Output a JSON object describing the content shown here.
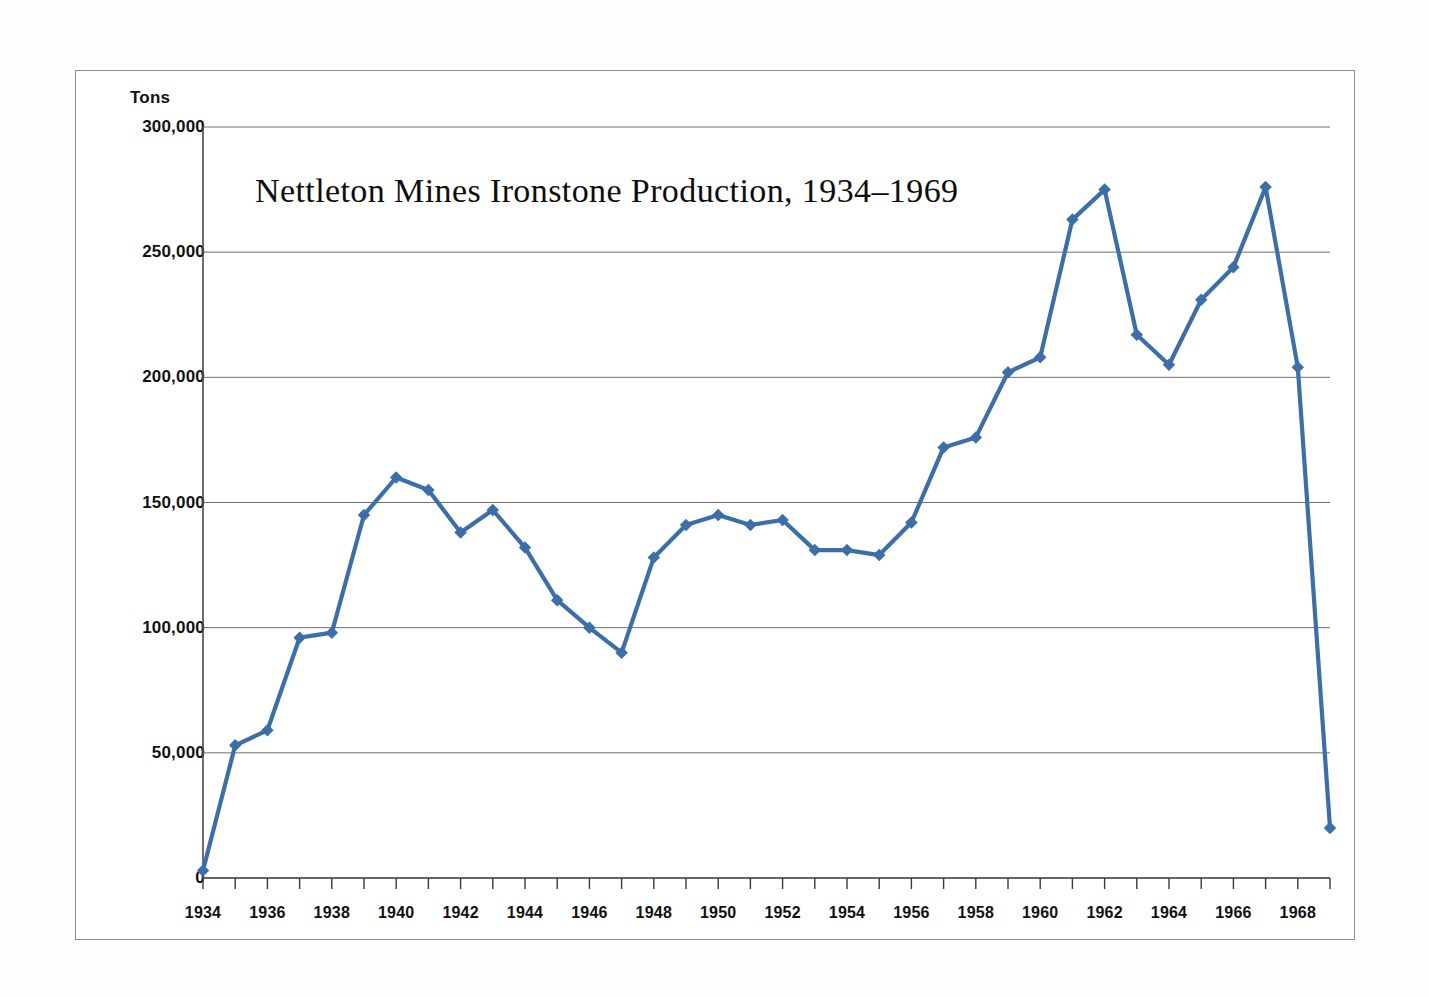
{
  "chart_data": {
    "type": "line",
    "title": "Nettleton Mines Ironstone Production, 1934–1969",
    "xlabel": "",
    "ylabel": "Tons",
    "ylim": [
      0,
      300000
    ],
    "xlim": [
      1934,
      1969
    ],
    "grid": true,
    "legend": "none",
    "y_ticks": [
      300000,
      250000,
      200000,
      150000,
      100000,
      50000,
      0
    ],
    "y_tick_labels": [
      "300,000",
      "250,000",
      "200,000",
      "150,000",
      "100,000",
      "50,000",
      "0"
    ],
    "x_ticks": [
      1934,
      1936,
      1938,
      1940,
      1942,
      1944,
      1946,
      1948,
      1950,
      1952,
      1954,
      1956,
      1958,
      1960,
      1962,
      1964,
      1966,
      1968
    ],
    "x_tick_labels": [
      "1934",
      "1936",
      "1938",
      "1940",
      "1942",
      "1944",
      "1946",
      "1948",
      "1950",
      "1952",
      "1954",
      "1956",
      "1958",
      "1960",
      "1962",
      "1964",
      "1966",
      "1968"
    ],
    "x_minor_ticks": [
      1934,
      1935,
      1936,
      1937,
      1938,
      1939,
      1940,
      1941,
      1942,
      1943,
      1944,
      1945,
      1946,
      1947,
      1948,
      1949,
      1950,
      1951,
      1952,
      1953,
      1954,
      1955,
      1956,
      1957,
      1958,
      1959,
      1960,
      1961,
      1962,
      1963,
      1964,
      1965,
      1966,
      1967,
      1968,
      1969
    ],
    "series_color": "#3c6fa8",
    "marker": "diamond",
    "x": [
      1934,
      1935,
      1936,
      1937,
      1938,
      1939,
      1940,
      1941,
      1942,
      1943,
      1944,
      1945,
      1946,
      1947,
      1948,
      1949,
      1950,
      1951,
      1952,
      1953,
      1954,
      1955,
      1956,
      1957,
      1958,
      1959,
      1960,
      1961,
      1962,
      1963,
      1964,
      1965,
      1966,
      1967,
      1968,
      1969
    ],
    "values": [
      3000,
      53000,
      59000,
      96000,
      98000,
      145000,
      160000,
      155000,
      138000,
      147000,
      132000,
      111000,
      100000,
      90000,
      128000,
      141000,
      145000,
      141000,
      143000,
      131000,
      131000,
      129000,
      142000,
      172000,
      176000,
      202000,
      208000,
      263000,
      275000,
      217000,
      205000,
      231000,
      244000,
      276000,
      204000,
      20000
    ],
    "series": [
      {
        "name": "Ironstone production (tons)",
        "values": [
          3000,
          53000,
          59000,
          96000,
          98000,
          145000,
          160000,
          155000,
          138000,
          147000,
          132000,
          111000,
          100000,
          90000,
          128000,
          141000,
          145000,
          141000,
          143000,
          131000,
          131000,
          129000,
          142000,
          172000,
          176000,
          202000,
          208000,
          263000,
          275000,
          217000,
          205000,
          231000,
          244000,
          276000,
          204000,
          20000
        ]
      }
    ]
  },
  "figure": {
    "axis_unit_label": "Tons",
    "title": "Nettleton Mines Ironstone Production, 1934–1969",
    "frame_color": "#8c8c8c",
    "background_color": "#ffffff",
    "line_color": "#3c6fa8"
  }
}
